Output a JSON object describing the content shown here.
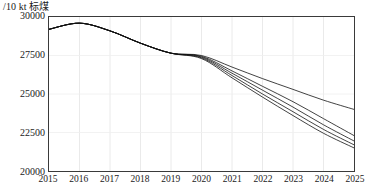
{
  "chart_data": {
    "type": "line",
    "title": "",
    "subtitle": "",
    "xlabel": "",
    "ylabel": "/10 kt 标煤",
    "y_unit_label": "/10 kt 标煤",
    "x": [
      2015,
      2016,
      2017,
      2018,
      2019,
      2020,
      2021,
      2022,
      2023,
      2024,
      2025
    ],
    "categories": [
      "2015",
      "2016",
      "2017",
      "2018",
      "2019",
      "2020",
      "2021",
      "2022",
      "2023",
      "2024",
      "2025"
    ],
    "xlim": [
      2015,
      2025
    ],
    "ylim": [
      20000,
      30000
    ],
    "y_ticks": [
      20000,
      22500,
      25000,
      27500,
      30000
    ],
    "y_tick_labels": [
      "20000",
      "22500",
      "25000",
      "27500",
      "30000"
    ],
    "x_ticks": [
      2015,
      2016,
      2017,
      2018,
      2019,
      2020,
      2021,
      2022,
      2023,
      2024,
      2025
    ],
    "x_tick_labels": [
      "2015",
      "2016",
      "2017",
      "2018",
      "2019",
      "2020",
      "2021",
      "2022",
      "2023",
      "2024",
      "2025"
    ],
    "grid": true,
    "grid_vertical": true,
    "grid_horizontal": true,
    "grid_color": "#e4e4e4",
    "axis_color": "#3a3a3a",
    "legend": false,
    "legend_position": "none",
    "line_color": "#111111",
    "line_width": 0.8,
    "series": [
      {
        "name": "Baseline scenario",
        "color": "#111111",
        "values": [
          29200,
          29600,
          29100,
          28300,
          27650,
          27500,
          26750,
          26000,
          25300,
          24600,
          24000
        ]
      },
      {
        "name": "Scenario 2",
        "color": "#111111",
        "values": [
          29200,
          29600,
          29100,
          28300,
          27650,
          27450,
          26500,
          25500,
          24500,
          23400,
          22300
        ]
      },
      {
        "name": "Scenario 3",
        "color": "#111111",
        "values": [
          29200,
          29600,
          29100,
          28300,
          27650,
          27400,
          26350,
          25250,
          24150,
          23000,
          21950
        ]
      },
      {
        "name": "Scenario 4",
        "color": "#111111",
        "values": [
          29200,
          29600,
          29100,
          28300,
          27650,
          27350,
          26200,
          25000,
          23850,
          22700,
          21700
        ]
      },
      {
        "name": "Scenario 5",
        "color": "#111111",
        "values": [
          29200,
          29600,
          29100,
          28300,
          27650,
          27300,
          26050,
          24800,
          23600,
          22450,
          21500
        ]
      }
    ]
  }
}
